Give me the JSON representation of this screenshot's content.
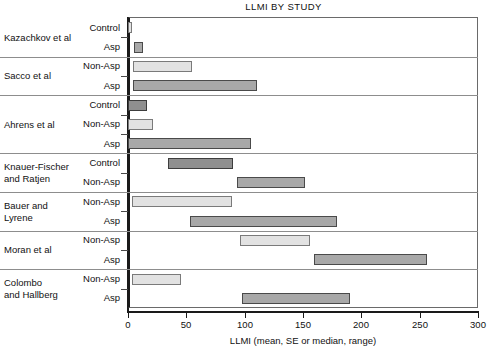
{
  "chart_data": {
    "type": "bar",
    "orientation": "horizontal",
    "title": "LLMI BY STUDY",
    "xlabel": "LLMI (mean, SE or median, range)",
    "ylabel": "",
    "xlim": [
      0,
      300
    ],
    "xticks": [
      0,
      50,
      100,
      150,
      200,
      250,
      300
    ],
    "xticklabels": [
      "0",
      "50",
      "100",
      "150",
      "200",
      "250",
      "300"
    ],
    "grid": false,
    "legend": null,
    "note": "Each bar is a floating range bar spanning [start, end] on the LLMI axis.",
    "groups": [
      {
        "study": "Kazachkov et al",
        "bars": [
          {
            "category": "Control",
            "start": 0,
            "end": 3,
            "shade": "light"
          },
          {
            "category": "Asp",
            "start": 5,
            "end": 13,
            "shade": "dark"
          }
        ]
      },
      {
        "study": "Sacco et al",
        "bars": [
          {
            "category": "Non-Asp",
            "start": 4,
            "end": 55,
            "shade": "light"
          },
          {
            "category": "Asp",
            "start": 4,
            "end": 111,
            "shade": "dark"
          }
        ]
      },
      {
        "study": "Ahrens et al",
        "bars": [
          {
            "category": "Control",
            "start": 0,
            "end": 16,
            "shade": "darker"
          },
          {
            "category": "Non-Asp",
            "start": 0,
            "end": 21,
            "shade": "light"
          },
          {
            "category": "Asp",
            "start": 0,
            "end": 105,
            "shade": "dark"
          }
        ]
      },
      {
        "study": "Knauer-Fischer\nand Ratjen",
        "bars": [
          {
            "category": "Control",
            "start": 34,
            "end": 90,
            "shade": "darker"
          },
          {
            "category": "Non-Asp",
            "start": 93,
            "end": 152,
            "shade": "dark"
          }
        ]
      },
      {
        "study": "Bauer and\nLyrene",
        "bars": [
          {
            "category": "Non-Asp",
            "start": 3,
            "end": 89,
            "shade": "light"
          },
          {
            "category": "Asp",
            "start": 53,
            "end": 179,
            "shade": "dark"
          }
        ]
      },
      {
        "study": "Moran et al",
        "bars": [
          {
            "category": "Non-Asp",
            "start": 96,
            "end": 156,
            "shade": "light"
          },
          {
            "category": "Asp",
            "start": 159,
            "end": 256,
            "shade": "dark"
          }
        ]
      },
      {
        "study": "Colombo\nand Hallberg",
        "bars": [
          {
            "category": "Non-Asp",
            "start": 3,
            "end": 45,
            "shade": "light"
          },
          {
            "category": "Asp",
            "start": 98,
            "end": 190,
            "shade": "dark"
          }
        ]
      }
    ]
  }
}
